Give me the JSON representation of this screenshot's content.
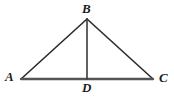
{
  "figure": {
    "kind": "geometry-diagram",
    "width": 174,
    "height": 98,
    "background_color": "#ffffff",
    "colors": {
      "base_line": "#555555",
      "side_line": "#2a2a2a",
      "cevian_line": "#3a3a3a",
      "label_text": "#1b1b1b"
    },
    "labels": {
      "apex": "B",
      "left": "A",
      "right": "C",
      "foot": "D"
    },
    "points": {
      "A": {
        "x": 21,
        "y": 79
      },
      "B": {
        "x": 87,
        "y": 19
      },
      "C": {
        "x": 153,
        "y": 79
      },
      "D": {
        "x": 87,
        "y": 79
      }
    },
    "segments": [
      {
        "name": "AB",
        "from": "A",
        "to": "B",
        "width": 1.6,
        "color": "#2a2a2a"
      },
      {
        "name": "BC",
        "from": "B",
        "to": "C",
        "width": 1.6,
        "color": "#2a2a2a"
      },
      {
        "name": "AC",
        "from": "A",
        "to": "C",
        "width": 2.4,
        "color": "#555555"
      },
      {
        "name": "BD",
        "from": "B",
        "to": "D",
        "width": 1.6,
        "color": "#3a3a3a"
      }
    ]
  }
}
